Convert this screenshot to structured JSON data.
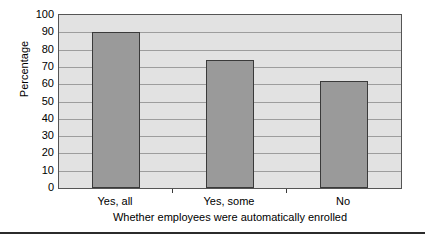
{
  "chart_data": {
    "type": "bar",
    "title": "",
    "subtitle": "",
    "categories": [
      "Yes, all",
      "Yes, some",
      "No"
    ],
    "values": [
      90,
      74,
      62
    ],
    "series": [
      {
        "name": "Percentage",
        "values": [
          90,
          74,
          62
        ]
      }
    ],
    "xlabel": "Whether employees were automatically enrolled",
    "ylabel": "Percentage",
    "ylim": [
      0,
      100
    ],
    "ytick_step": 10,
    "yticks": [
      0,
      10,
      20,
      30,
      40,
      50,
      60,
      70,
      80,
      90,
      100
    ],
    "ytick_labels": [
      "0",
      "10",
      "20",
      "30",
      "40",
      "50",
      "60",
      "70",
      "80",
      "90",
      "100"
    ],
    "grid": "horizontal",
    "legend": "none",
    "annotations": [],
    "colors": {
      "bar_fill": "#9a9a9a",
      "bar_edge": "#3a3a3a",
      "plot_background": "#e2e2e2",
      "gridline": "#9d9d9d",
      "axis": "#555555",
      "text": "#000000",
      "bottom_rule": "#2b2b2b"
    }
  }
}
